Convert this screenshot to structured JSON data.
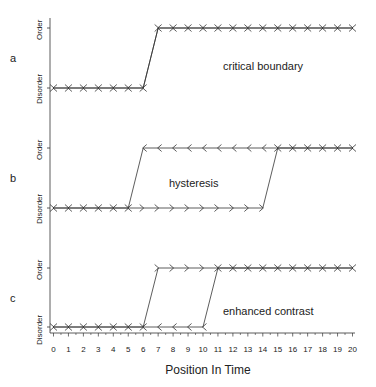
{
  "chart_data": {
    "type": "line",
    "title": "",
    "xlabel": "Position In Time",
    "ylabel": "",
    "x": [
      0,
      1,
      2,
      3,
      4,
      5,
      6,
      7,
      8,
      9,
      10,
      11,
      12,
      13,
      14,
      15,
      16,
      17,
      18,
      19,
      20
    ],
    "xlim": [
      0,
      20
    ],
    "x_tick_labels": [
      "0",
      "1",
      "2",
      "3",
      "4",
      "5",
      "6",
      "7",
      "8",
      "9",
      "10",
      "11",
      "12",
      "13",
      "14",
      "15",
      "16",
      "17",
      "18",
      "19",
      "20"
    ],
    "y_tick_labels": [
      "Disorder",
      "Order"
    ],
    "grid": false,
    "legend": "none",
    "panels": [
      {
        "label": "a",
        "annotation": "critical boundary",
        "series": [
          {
            "name": "forward",
            "marker": ">",
            "values": [
              0,
              0,
              0,
              0,
              0,
              0,
              0,
              1,
              1,
              1,
              1,
              1,
              1,
              1,
              1,
              1,
              1,
              1,
              1,
              1,
              1
            ]
          },
          {
            "name": "backward",
            "marker": "<",
            "values": [
              0,
              0,
              0,
              0,
              0,
              0,
              0,
              1,
              1,
              1,
              1,
              1,
              1,
              1,
              1,
              1,
              1,
              1,
              1,
              1,
              1
            ]
          }
        ],
        "transition": {
          "from_x": 6,
          "to_x": 7
        }
      },
      {
        "label": "b",
        "annotation": "hysteresis",
        "series": [
          {
            "name": "forward",
            "marker": ">",
            "values": [
              0,
              0,
              0,
              0,
              0,
              0,
              0,
              0,
              0,
              0,
              0,
              0,
              0,
              0,
              0,
              1,
              1,
              1,
              1,
              1,
              1
            ]
          },
          {
            "name": "backward",
            "marker": "<",
            "values": [
              0,
              0,
              0,
              0,
              0,
              0,
              1,
              1,
              1,
              1,
              1,
              1,
              1,
              1,
              1,
              1,
              1,
              1,
              1,
              1,
              1
            ]
          }
        ],
        "transitions": [
          {
            "direction": "forward",
            "from_x": 14,
            "to_x": 15
          },
          {
            "direction": "backward",
            "from_x": 6,
            "to_x": 5
          }
        ]
      },
      {
        "label": "c",
        "annotation": "enhanced contrast",
        "series": [
          {
            "name": "forward",
            "marker": ">",
            "values": [
              0,
              0,
              0,
              0,
              0,
              0,
              0,
              1,
              1,
              1,
              1,
              1,
              1,
              1,
              1,
              1,
              1,
              1,
              1,
              1,
              1
            ]
          },
          {
            "name": "backward",
            "marker": "<",
            "values": [
              0,
              0,
              0,
              0,
              0,
              0,
              0,
              0,
              0,
              0,
              0,
              1,
              1,
              1,
              1,
              1,
              1,
              1,
              1,
              1,
              1
            ]
          }
        ],
        "transitions": [
          {
            "direction": "forward",
            "from_x": 6,
            "to_x": 7
          },
          {
            "direction": "backward",
            "from_x": 11,
            "to_x": 10
          }
        ]
      }
    ]
  },
  "labels": {
    "panel_a": "a",
    "panel_b": "b",
    "panel_c": "c",
    "annotation_a": "critical boundary",
    "annotation_b": "hysteresis",
    "annotation_c": "enhanced contrast",
    "order": "Order",
    "disorder": "Disorder",
    "xlabel": "Position In Time"
  }
}
